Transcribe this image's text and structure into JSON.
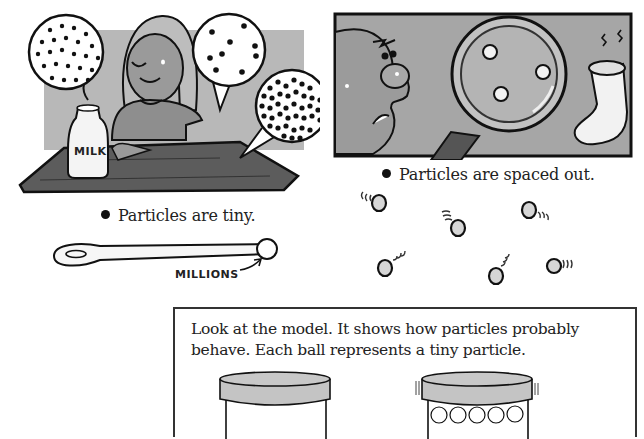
{
  "panels": {
    "milk_scene": {
      "bottle_label": "MILK",
      "caption": "Particles are tiny.",
      "bubbles": [
        "sparse-dots",
        "medium-dots",
        "dense-dots"
      ]
    },
    "smell_scene": {
      "caption": "Particles are spaced out."
    },
    "spoon": {
      "label": "MILLIONS"
    },
    "moving_particles": {
      "count": 6
    }
  },
  "model_box": {
    "text": "Look at the model. It shows how particles probably behave. Each ball represents a tiny particle.",
    "containers": [
      "empty-container",
      "container-with-balls"
    ]
  },
  "colors": {
    "ink": "#1a1a1a",
    "panel_gray": "#a9a9a9",
    "table": "#5a5a5a",
    "lid_gray": "#c4c4c4",
    "particle_fill": "#d8d8d8"
  }
}
